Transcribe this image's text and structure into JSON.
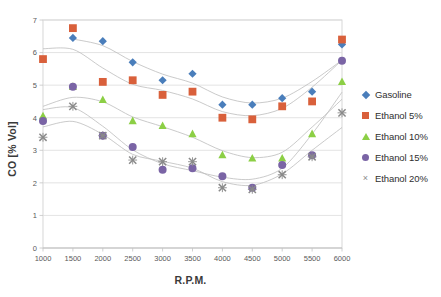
{
  "chart_data": {
    "type": "scatter",
    "title": "",
    "xlabel": "R.P.M.",
    "ylabel": "CO [% Vol]",
    "x": [
      1000,
      1500,
      2000,
      2500,
      3000,
      3500,
      4000,
      4500,
      5000,
      5500,
      6000
    ],
    "xlim": [
      1000,
      6000
    ],
    "ylim": [
      0,
      7
    ],
    "xticks": [
      "1000",
      "1500",
      "2000",
      "2500",
      "3000",
      "3500",
      "4000",
      "4500",
      "5000",
      "5500",
      "6000"
    ],
    "yticks": [
      "0",
      "1",
      "2",
      "3",
      "4",
      "5",
      "6",
      "7"
    ],
    "grid": true,
    "legend_position": "right",
    "series": [
      {
        "name": "Gasoline",
        "marker": "diamond",
        "color": "#4a7ebb",
        "values": [
          null,
          6.45,
          6.35,
          5.7,
          5.15,
          5.35,
          4.4,
          4.4,
          4.6,
          4.8,
          6.25
        ]
      },
      {
        "name": "Ethanol 5%",
        "marker": "square",
        "color": "#d9603b",
        "values": [
          5.8,
          6.75,
          5.1,
          5.15,
          4.7,
          4.8,
          4.0,
          3.95,
          4.35,
          4.5,
          6.4
        ]
      },
      {
        "name": "Ethanol 10%",
        "marker": "triangle",
        "color": "#8ccf45",
        "values": [
          4.05,
          4.95,
          4.55,
          3.9,
          3.75,
          3.5,
          2.85,
          2.75,
          2.75,
          3.5,
          5.1
        ]
      },
      {
        "name": "Ethanol 15%",
        "marker": "circle",
        "color": "#7a64a5",
        "values": [
          3.9,
          4.95,
          3.45,
          3.1,
          2.4,
          2.45,
          2.2,
          1.85,
          2.55,
          2.85,
          5.75
        ]
      },
      {
        "name": "Ethanol 20%",
        "marker": "cross",
        "color": "#8a8a8a",
        "values": [
          3.4,
          4.35,
          3.45,
          2.7,
          2.65,
          2.65,
          1.85,
          1.8,
          2.25,
          2.8,
          4.15
        ]
      }
    ],
    "trendlines": [
      {
        "name": "Gasoline",
        "color": "#bdbdbd"
      },
      {
        "name": "Ethanol 5%",
        "color": "#bdbdbd"
      },
      {
        "name": "Ethanol 10%",
        "color": "#bdbdbd"
      },
      {
        "name": "Ethanol 15%",
        "color": "#bdbdbd"
      },
      {
        "name": "Ethanol 20%",
        "color": "#bdbdbd"
      }
    ]
  },
  "legend": {
    "items": [
      {
        "label": "Gasoline",
        "marker": "diamond-icon"
      },
      {
        "label": "Ethanol 5%",
        "marker": "square-icon"
      },
      {
        "label": "Ethanol 10%",
        "marker": "triangle-icon"
      },
      {
        "label": "Ethanol 15%",
        "marker": "circle-icon"
      },
      {
        "label": "Ethanol 20%",
        "marker": "cross-icon"
      }
    ]
  },
  "axes": {
    "x_title": "R.P.M.",
    "y_title": "CO [% Vol]"
  }
}
